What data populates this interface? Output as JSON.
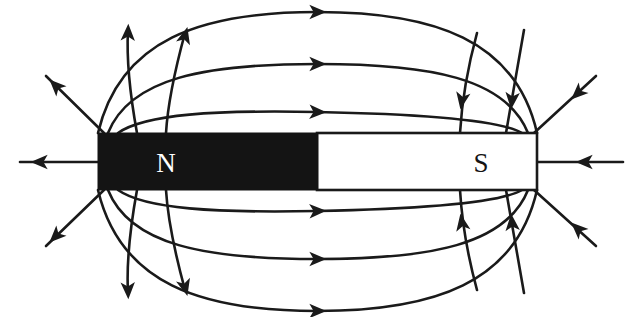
{
  "figure": {
    "width": 643,
    "height": 317,
    "background_color": "#ffffff",
    "line_color": "#1a1a1a"
  },
  "magnet": {
    "north_pole": {
      "label": "N",
      "fill_color": "#141414",
      "label_color": "#ffffff",
      "x": 98,
      "y": 133,
      "width": 219,
      "height": 57
    },
    "south_pole": {
      "label": "S",
      "fill_color": "#ffffff",
      "label_color": "#141414",
      "stroke_color": "#1a1a1a",
      "x": 317,
      "y": 133,
      "width": 220,
      "height": 57
    }
  },
  "chart_data": {
    "type": "diagram",
    "field_direction": "north-to-south",
    "arc_count_top": 3,
    "arc_count_bottom": 3,
    "radial_lines_per_corner": 3,
    "axial_lines": 2
  },
  "field_lines": {
    "axial": [
      {
        "name": "north-axial-line",
        "path": "M 98 162 L 20 162",
        "arrow_at": {
          "x": 40,
          "y": 162,
          "angle": 180
        }
      },
      {
        "name": "south-axial-line",
        "path": "M 537 162 L 623 162",
        "arrow_at": {
          "x": 585,
          "y": 162,
          "angle": 180
        }
      }
    ],
    "arcs_top": [
      {
        "name": "arc-top-outer",
        "path": "M 98 133 C 120 40, 200 12, 317 12 C 434 12, 516 40, 537 133",
        "arrow_at": {
          "x": 317,
          "y": 12,
          "angle": 0
        }
      },
      {
        "name": "arc-top-middle",
        "path": "M 108 133 C 130 78, 205 64, 317 64 C 430 64, 506 78, 528 133",
        "arrow_at": {
          "x": 317,
          "y": 64,
          "angle": 0
        }
      },
      {
        "name": "arc-top-inner",
        "path": "M 118 133 C 145 114, 215 110, 317 112 C 420 114, 500 120, 522 133",
        "arrow_at": {
          "x": 317,
          "y": 112,
          "angle": 2
        }
      }
    ],
    "arcs_bottom": [
      {
        "name": "arc-bottom-inner",
        "path": "M 118 190 C 145 209, 215 213, 317 211 C 420 209, 500 203, 522 190",
        "arrow_at": {
          "x": 317,
          "y": 211,
          "angle": -2
        }
      },
      {
        "name": "arc-bottom-middle",
        "path": "M 108 190 C 130 245, 205 259, 317 259 C 430 259, 506 245, 528 190",
        "arrow_at": {
          "x": 317,
          "y": 259,
          "angle": 0
        }
      },
      {
        "name": "arc-bottom-outer",
        "path": "M 98 190 C 120 283, 200 311, 317 311 C 434 311, 516 283, 537 190",
        "arrow_at": {
          "x": 317,
          "y": 311,
          "angle": 0
        }
      }
    ],
    "radial_north_top": [
      {
        "name": "north-radial-upper-diagonal",
        "path": "M 104 133 L 46 76",
        "arrow_at": {
          "x": 56,
          "y": 86,
          "angle": 225
        }
      },
      {
        "name": "north-radial-upper-left-curve",
        "path": "M 137 133 C 131 100, 126 66, 128 30",
        "arrow_at": {
          "x": 128,
          "y": 33,
          "angle": 272
        }
      },
      {
        "name": "north-radial-upper-right-curve",
        "path": "M 166 133 C 168 100, 176 66, 185 33",
        "arrow_at": {
          "x": 185,
          "y": 36,
          "angle": 285
        }
      }
    ],
    "radial_north_bottom": [
      {
        "name": "north-radial-lower-diagonal",
        "path": "M 104 190 L 46 246",
        "arrow_at": {
          "x": 56,
          "y": 236,
          "angle": 135
        }
      },
      {
        "name": "north-radial-lower-left-curve",
        "path": "M 137 190 C 131 223, 126 257, 128 293",
        "arrow_at": {
          "x": 128,
          "y": 290,
          "angle": 88
        }
      },
      {
        "name": "north-radial-lower-right-curve",
        "path": "M 166 190 C 168 223, 176 257, 185 290",
        "arrow_at": {
          "x": 185,
          "y": 287,
          "angle": 75
        }
      }
    ],
    "radial_south_top": [
      {
        "name": "south-radial-upper-left-curve",
        "path": "M 477 33 C 468 66, 462 100, 460 133",
        "arrow_at": {
          "x": 462,
          "y": 100,
          "angle": 100
        }
      },
      {
        "name": "south-radial-upper-right-curve",
        "path": "M 524 30 C 518 66, 512 100, 506 133",
        "arrow_at": {
          "x": 512,
          "y": 100,
          "angle": 95
        }
      },
      {
        "name": "south-radial-upper-diagonal",
        "path": "M 596 76 L 534 133",
        "arrow_at": {
          "x": 578,
          "y": 93,
          "angle": 137
        }
      }
    ],
    "radial_south_bottom": [
      {
        "name": "south-radial-lower-left-curve",
        "path": "M 477 290 C 468 257, 462 223, 460 190",
        "arrow_at": {
          "x": 462,
          "y": 223,
          "angle": 260
        }
      },
      {
        "name": "south-radial-lower-right-curve",
        "path": "M 524 293 C 518 257, 512 223, 506 190",
        "arrow_at": {
          "x": 512,
          "y": 223,
          "angle": 265
        }
      },
      {
        "name": "south-radial-lower-diagonal",
        "path": "M 596 246 L 534 190",
        "arrow_at": {
          "x": 578,
          "y": 229,
          "angle": 223
        }
      }
    ]
  }
}
